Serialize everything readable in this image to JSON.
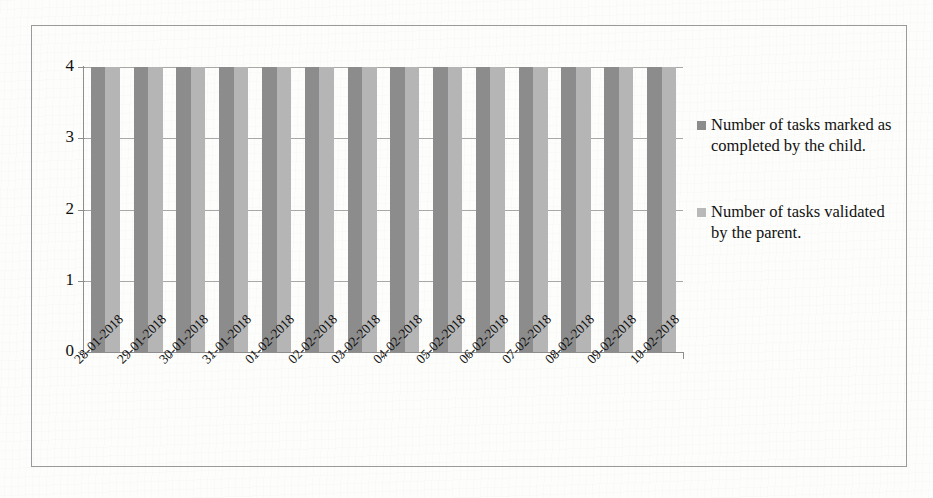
{
  "chart_data": {
    "type": "bar",
    "title": "",
    "xlabel": "",
    "ylabel": "",
    "ylim": [
      0,
      4
    ],
    "yticks": [
      "0",
      "1",
      "2",
      "3",
      "4"
    ],
    "grid": true,
    "legend_position": "right",
    "categories": [
      "28-01-2018",
      "29-01-2018",
      "30-01-2018",
      "31-01-2018",
      "01-02-2018",
      "02-02-2018",
      "03-02-2018",
      "04-02-2018",
      "05-02-2018",
      "06-02-2018",
      "07-02-2018",
      "08-02-2018",
      "09-02-2018",
      "10-02-2018"
    ],
    "series": [
      {
        "name": "Number of tasks marked as completed by the child.",
        "color": "#8c8c8c",
        "values": [
          4,
          4,
          4,
          4,
          4,
          4,
          4,
          4,
          4,
          4,
          4,
          4,
          4,
          4
        ]
      },
      {
        "name": "Number of tasks validated by the parent.",
        "color": "#b5b5b5",
        "values": [
          4,
          4,
          4,
          4,
          4,
          4,
          4,
          4,
          4,
          4,
          4,
          4,
          4,
          4
        ]
      }
    ]
  },
  "legend": {
    "entries": [
      {
        "label": "Number of tasks marked as completed by the child."
      },
      {
        "label": "Number of tasks validated by the parent."
      }
    ]
  }
}
